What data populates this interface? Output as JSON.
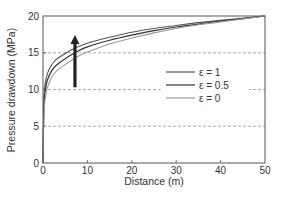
{
  "chart_data": {
    "type": "line",
    "title": "",
    "xlabel": "Distance (m)",
    "ylabel": "Pressure drawdown (MPa)",
    "xlim": [
      0,
      50
    ],
    "ylim": [
      0,
      20
    ],
    "xticks": [
      0,
      10,
      20,
      30,
      40,
      50
    ],
    "yticks": [
      0,
      5,
      10,
      15,
      20
    ],
    "grid": {
      "horizontal_dashed": [
        5,
        10,
        15
      ]
    },
    "legend_position": "right-middle inside",
    "annotations": [
      {
        "type": "arrow",
        "direction": "up",
        "x": 7.2,
        "y_from": 10.3,
        "y_to": 17.4,
        "meaning": "increasing epsilon"
      }
    ],
    "x": [
      0,
      0.2,
      0.5,
      1,
      2,
      3,
      5,
      7.5,
      10,
      15,
      20,
      25,
      30,
      35,
      40,
      45,
      50
    ],
    "series": [
      {
        "name": "ε = 1",
        "color": "#555555",
        "values": [
          0,
          8.5,
          10.8,
          12.2,
          13.4,
          14.1,
          14.9,
          15.7,
          16.3,
          17.1,
          17.8,
          18.3,
          18.7,
          19.1,
          19.4,
          19.7,
          20
        ]
      },
      {
        "name": "ε = 0.5",
        "color": "#333333",
        "values": [
          0,
          7.5,
          9.8,
          11.3,
          12.6,
          13.3,
          14.2,
          15.1,
          15.8,
          16.7,
          17.4,
          18.0,
          18.5,
          18.9,
          19.3,
          19.65,
          20
        ]
      },
      {
        "name": "ε = 0",
        "color": "#9a9a9a",
        "values": [
          0,
          6.5,
          8.8,
          10.3,
          11.7,
          12.5,
          13.4,
          14.4,
          15.1,
          16.2,
          17.0,
          17.7,
          18.3,
          18.8,
          19.2,
          19.6,
          20
        ]
      }
    ]
  },
  "axes": {
    "xlabel": "Distance (m)",
    "ylabel": "Pressure drawdown (MPa)",
    "xtick_labels": [
      "0",
      "10",
      "20",
      "30",
      "40",
      "50"
    ],
    "ytick_labels": [
      "0",
      "5",
      "10",
      "15",
      "20"
    ]
  },
  "legend": {
    "items": [
      {
        "label": "ε = 1",
        "color": "#555555"
      },
      {
        "label": "ε = 0.5",
        "color": "#333333"
      },
      {
        "label": "ε = 0",
        "color": "#9a9a9a"
      }
    ]
  }
}
